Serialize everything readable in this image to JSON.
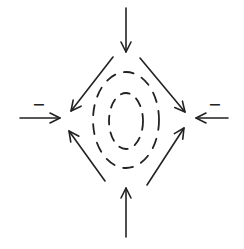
{
  "diagram": {
    "colors": {
      "background": "#ffffff",
      "ink": "#222222"
    },
    "center": {
      "x": 126,
      "y": 122
    },
    "contours": [
      {
        "name": "outer",
        "style": "dashed",
        "cx": 126,
        "cy": 120,
        "rx": 33,
        "ry": 48
      },
      {
        "name": "inner",
        "style": "dashed",
        "cx": 126,
        "cy": 121,
        "rx": 17,
        "ry": 28
      }
    ],
    "arrows": [
      {
        "name": "top-inflow",
        "from": [
          126,
          8
        ],
        "to": [
          126,
          52
        ],
        "direction": "down"
      },
      {
        "name": "bottom-inflow",
        "from": [
          126,
          237
        ],
        "to": [
          126,
          188
        ],
        "direction": "up"
      },
      {
        "name": "left-inflow",
        "from": [
          20,
          118
        ],
        "to": [
          60,
          118
        ],
        "direction": "right"
      },
      {
        "name": "right-inflow",
        "from": [
          228,
          118
        ],
        "to": [
          196,
          118
        ],
        "direction": "left"
      },
      {
        "name": "upper-left-diagonal",
        "from": [
          113,
          57
        ],
        "to": [
          71,
          111
        ],
        "direction": "down-left"
      },
      {
        "name": "upper-right-diagonal",
        "from": [
          140,
          58
        ],
        "to": [
          185,
          112
        ],
        "direction": "down-right"
      },
      {
        "name": "lower-left-diagonal",
        "from": [
          105,
          181
        ],
        "to": [
          69,
          131
        ],
        "direction": "up-left"
      },
      {
        "name": "lower-right-diagonal",
        "from": [
          147,
          185
        ],
        "to": [
          184,
          128
        ],
        "direction": "up-right"
      }
    ],
    "labels": {
      "left_sign": "−",
      "right_sign": "−"
    }
  }
}
